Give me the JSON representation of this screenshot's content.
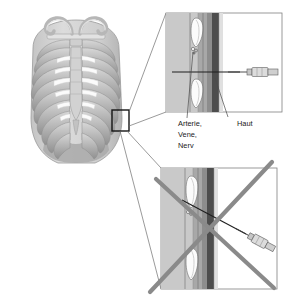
{
  "thorax": {
    "name": "ribcage-anterior-view",
    "rib_pair_count": 10,
    "parts": {
      "clavicle_left": "Clavicula links",
      "clavicle_right": "Clavicula rechts",
      "manubrium": "Manubrium sterni",
      "sternum": "Sternum",
      "xiphoid": "Processus xiphoideus",
      "abdomen": "Abdomen"
    },
    "selection_box": {
      "label": "Ausschnitt",
      "x": 112,
      "y": 110,
      "width": 17,
      "height": 21
    }
  },
  "panels": [
    {
      "id": "panel-correct",
      "title": "Richtige Punktion",
      "status": "correct",
      "crossed_out": false,
      "needle_angle": "horizontal",
      "layers": [
        {
          "name": "Muskulatur",
          "color": "#c9c9c9"
        },
        {
          "name": "Faszie",
          "color": "#a8a8a8"
        },
        {
          "name": "Subkutangewebe",
          "color": "#8d8d8d"
        },
        {
          "name": "Haut",
          "color": "#4d4d4d"
        }
      ],
      "ribs": [
        "Rippe oben",
        "Rippe unten"
      ]
    },
    {
      "id": "panel-incorrect",
      "title": "Falsche Punktion",
      "status": "incorrect",
      "crossed_out": true,
      "needle_angle": "schraeg",
      "layers": [
        {
          "name": "Muskulatur",
          "color": "#c9c9c9"
        },
        {
          "name": "Faszie",
          "color": "#a8a8a8"
        },
        {
          "name": "Subkutangewebe",
          "color": "#8d8d8d"
        },
        {
          "name": "Haut",
          "color": "#4d4d4d"
        }
      ],
      "ribs": [
        "Rippe oben",
        "Rippe unten"
      ]
    }
  ],
  "labels": {
    "bundle_line1": "Arterie,",
    "bundle_line2": "Vene,",
    "bundle_line3": "Nerv",
    "skin": "Haut"
  },
  "colors": {
    "bone_light": "#e9e9e9",
    "bone_mid": "#bdbdbd",
    "bone_shadow": "#9b9b9b",
    "body_fill": "#d3d3d3",
    "body_dark": "#a9a9a9",
    "skin_band": "#4d4d4d",
    "outline": "#4a4a4a",
    "leader": "#6f6f6f",
    "cross_mark": "#8a8a8a",
    "text": "#1a1a1a",
    "box_border": "#141414"
  }
}
